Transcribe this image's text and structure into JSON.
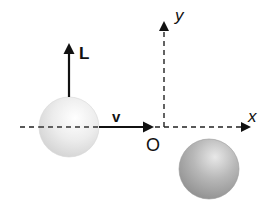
{
  "diagram": {
    "title": "",
    "axes": {
      "x_label": "x",
      "y_label": "y",
      "origin_label": "O"
    },
    "vectors": {
      "angular_momentum_label": "L",
      "velocity_label": "v"
    },
    "spheres": [
      {
        "name": "moving-sphere",
        "shade": "light",
        "color": "#e4e4e4"
      },
      {
        "name": "target-sphere",
        "shade": "dark",
        "color": "#a8a8a8"
      }
    ]
  }
}
